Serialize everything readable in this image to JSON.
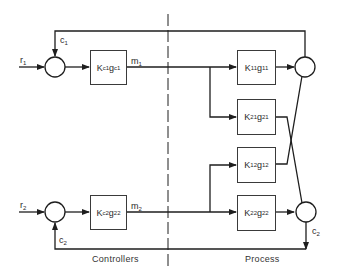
{
  "diagram": {
    "type": "block-diagram",
    "sections": {
      "controllers_label": "Controllers",
      "process_label": "Process"
    },
    "signals": {
      "r1": {
        "base": "r",
        "sub": "1"
      },
      "r2": {
        "base": "r",
        "sub": "2"
      },
      "c1": {
        "base": "c",
        "sub": "1"
      },
      "c2_feedback": {
        "base": "c",
        "sub": "2"
      },
      "c2_output": {
        "base": "c",
        "sub": "2"
      },
      "m1": {
        "base": "m",
        "sub": "1"
      },
      "m2": {
        "base": "m",
        "sub": "2"
      }
    },
    "blocks": {
      "controller1": {
        "k": "K",
        "ksub": "c1",
        "g": "g",
        "gsub": "c1"
      },
      "controller2": {
        "k": "K",
        "ksub": "c2",
        "g": "g",
        "gsub": "22"
      },
      "process11": {
        "k": "K",
        "ksub": "11",
        "g": "g",
        "gsub": "11"
      },
      "process21": {
        "k": "K",
        "ksub": "21",
        "g": "g",
        "gsub": "21"
      },
      "process12": {
        "k": "K",
        "ksub": "12",
        "g": "g",
        "gsub": "12"
      },
      "process22": {
        "k": "K",
        "ksub": "22",
        "g": "g",
        "gsub": "22"
      }
    },
    "summing_junctions": [
      "sum-r1",
      "sum-r2",
      "sum-c1",
      "sum-c2"
    ],
    "colors": {
      "line": "#1e1e1e",
      "background": "#ffffff"
    }
  }
}
